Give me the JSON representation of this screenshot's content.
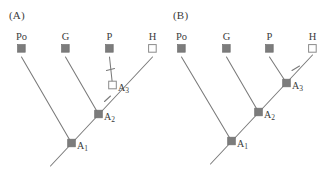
{
  "figure": {
    "colors": {
      "line": "#7a7a7a",
      "filled_square": "#7c7c7c",
      "open_square_fill": "#ffffff",
      "open_square_stroke": "#8a8a8a",
      "text": "#3b3b3b",
      "background": "#ffffff"
    },
    "panels": [
      {
        "id": "A",
        "label": "(A)",
        "taxa": [
          {
            "name": "Po",
            "label": "Po",
            "state": "filled"
          },
          {
            "name": "G",
            "label": "G",
            "state": "filled"
          },
          {
            "name": "P",
            "label": "P",
            "state": "filled"
          },
          {
            "name": "H",
            "label": "H",
            "state": "open"
          }
        ],
        "nodes": [
          {
            "name": "A1",
            "label": "A",
            "subscript": "1",
            "state": "filled"
          },
          {
            "name": "A2",
            "label": "A",
            "subscript": "2",
            "state": "filled"
          },
          {
            "name": "A3",
            "label": "A",
            "subscript": "3",
            "state": "open"
          }
        ],
        "ticks": [
          {
            "name": "tick-on-p-branch",
            "branch": "P"
          },
          {
            "name": "tick-on-backbone-a2-a3",
            "branch": "A2-A3"
          }
        ]
      },
      {
        "id": "B",
        "label": "(B)",
        "taxa": [
          {
            "name": "Po",
            "label": "Po",
            "state": "filled"
          },
          {
            "name": "G",
            "label": "G",
            "state": "filled"
          },
          {
            "name": "P",
            "label": "P",
            "state": "filled"
          },
          {
            "name": "H",
            "label": "H",
            "state": "open"
          }
        ],
        "nodes": [
          {
            "name": "A1",
            "label": "A",
            "subscript": "1",
            "state": "filled"
          },
          {
            "name": "A2",
            "label": "A",
            "subscript": "2",
            "state": "filled"
          },
          {
            "name": "A3",
            "label": "A",
            "subscript": "3",
            "state": "filled"
          }
        ],
        "ticks": [
          {
            "name": "tick-on-h-branch",
            "branch": "H"
          }
        ]
      }
    ]
  }
}
